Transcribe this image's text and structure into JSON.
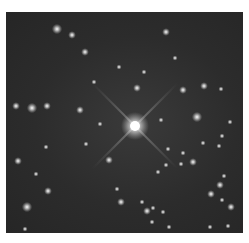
{
  "image": {
    "subject": "star field",
    "description": "Grayscale astronomical image of a dense star field with one bright central star showing four diffraction spikes",
    "colors": {
      "background": "#2c2c2c",
      "star": "#ffffff",
      "frame": "#ffffff"
    }
  }
}
